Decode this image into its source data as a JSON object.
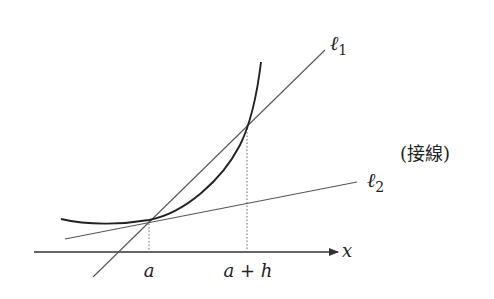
{
  "diagram": {
    "type": "tangent-secant-illustration",
    "curve": "convex increasing curve y=f(x)",
    "lines": {
      "l1": {
        "label": "ℓ",
        "subscript": "1",
        "meaning": "secant through (a, f(a)) and (a+h, f(a+h))"
      },
      "l2": {
        "label": "ℓ",
        "subscript": "2",
        "meaning": "tangent at x=a"
      }
    },
    "annotation": "(接線)",
    "axis": {
      "label": "x"
    },
    "ticks": [
      {
        "label": "a"
      },
      {
        "label": "a + h"
      }
    ],
    "colors": {
      "curve": "#222222",
      "lines": "#555555",
      "axis": "#333333"
    }
  }
}
